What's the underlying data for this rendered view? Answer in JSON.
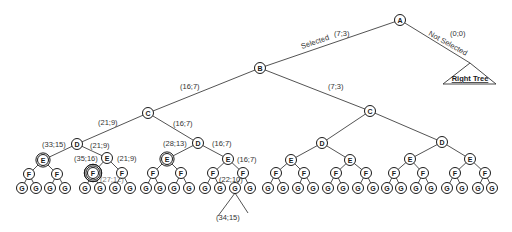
{
  "diagram": {
    "title": "",
    "node_radius": 5.5,
    "nodes": [
      {
        "id": "A",
        "label": "A",
        "x": 400,
        "y": 20
      },
      {
        "id": "B",
        "label": "B",
        "x": 260,
        "y": 68
      },
      {
        "id": "C1",
        "label": "C",
        "x": 148,
        "y": 113
      },
      {
        "id": "C2",
        "label": "C",
        "x": 370,
        "y": 111
      },
      {
        "id": "D1",
        "label": "D",
        "x": 77,
        "y": 144
      },
      {
        "id": "D2",
        "label": "D",
        "x": 198,
        "y": 143
      },
      {
        "id": "D3",
        "label": "D",
        "x": 322,
        "y": 143
      },
      {
        "id": "D4",
        "label": "D",
        "x": 442,
        "y": 142
      },
      {
        "id": "E1",
        "label": "E",
        "x": 43,
        "y": 160,
        "rings": 2
      },
      {
        "id": "E2",
        "label": "E",
        "x": 107,
        "y": 158
      },
      {
        "id": "E3",
        "label": "E",
        "x": 167,
        "y": 159,
        "rings": 2
      },
      {
        "id": "E4",
        "label": "E",
        "x": 228,
        "y": 159
      },
      {
        "id": "E5",
        "label": "E",
        "x": 291,
        "y": 160
      },
      {
        "id": "E6",
        "label": "E",
        "x": 350,
        "y": 160
      },
      {
        "id": "E7",
        "label": "E",
        "x": 410,
        "y": 159
      },
      {
        "id": "E8",
        "label": "E",
        "x": 470,
        "y": 159
      },
      {
        "id": "F1",
        "label": "F",
        "x": 29,
        "y": 174
      },
      {
        "id": "F2",
        "label": "F",
        "x": 57,
        "y": 174
      },
      {
        "id": "F3",
        "label": "F",
        "x": 93,
        "y": 173,
        "rings": 3
      },
      {
        "id": "F4",
        "label": "F",
        "x": 122,
        "y": 173
      },
      {
        "id": "F5",
        "label": "F",
        "x": 153,
        "y": 173
      },
      {
        "id": "F6",
        "label": "F",
        "x": 181,
        "y": 173
      },
      {
        "id": "F7",
        "label": "F",
        "x": 213,
        "y": 173
      },
      {
        "id": "F8",
        "label": "F",
        "x": 243,
        "y": 173
      },
      {
        "id": "F9",
        "label": "F",
        "x": 276,
        "y": 173
      },
      {
        "id": "F10",
        "label": "F",
        "x": 304,
        "y": 173
      },
      {
        "id": "F11",
        "label": "F",
        "x": 336,
        "y": 173
      },
      {
        "id": "F12",
        "label": "F",
        "x": 366,
        "y": 173
      },
      {
        "id": "F13",
        "label": "F",
        "x": 394,
        "y": 173
      },
      {
        "id": "F14",
        "label": "F",
        "x": 423,
        "y": 173
      },
      {
        "id": "F15",
        "label": "F",
        "x": 455,
        "y": 173
      },
      {
        "id": "F16",
        "label": "F",
        "x": 485,
        "y": 173
      },
      {
        "id": "G1",
        "label": "G",
        "x": 22,
        "y": 188
      },
      {
        "id": "G2",
        "label": "G",
        "x": 36,
        "y": 188
      },
      {
        "id": "G3",
        "label": "G",
        "x": 50,
        "y": 188
      },
      {
        "id": "G4",
        "label": "G",
        "x": 65,
        "y": 188
      },
      {
        "id": "G5",
        "label": "G",
        "x": 85,
        "y": 188
      },
      {
        "id": "G6",
        "label": "G",
        "x": 100,
        "y": 188
      },
      {
        "id": "G7",
        "label": "G",
        "x": 115,
        "y": 188
      },
      {
        "id": "G8",
        "label": "G",
        "x": 130,
        "y": 188
      },
      {
        "id": "G9",
        "label": "G",
        "x": 146,
        "y": 188
      },
      {
        "id": "G10",
        "label": "G",
        "x": 160,
        "y": 188
      },
      {
        "id": "G11",
        "label": "G",
        "x": 174,
        "y": 188
      },
      {
        "id": "G12",
        "label": "G",
        "x": 189,
        "y": 188
      },
      {
        "id": "G13",
        "label": "G",
        "x": 205,
        "y": 188
      },
      {
        "id": "G14",
        "label": "G",
        "x": 220,
        "y": 188
      },
      {
        "id": "G15",
        "label": "G",
        "x": 235,
        "y": 188
      },
      {
        "id": "G16",
        "label": "G",
        "x": 250,
        "y": 188
      },
      {
        "id": "G17",
        "label": "G",
        "x": 268,
        "y": 188
      },
      {
        "id": "G18",
        "label": "G",
        "x": 283,
        "y": 188
      },
      {
        "id": "G19",
        "label": "G",
        "x": 298,
        "y": 188
      },
      {
        "id": "G20",
        "label": "G",
        "x": 313,
        "y": 188
      },
      {
        "id": "G21",
        "label": "G",
        "x": 328,
        "y": 188
      },
      {
        "id": "G22",
        "label": "G",
        "x": 343,
        "y": 188
      },
      {
        "id": "G23",
        "label": "G",
        "x": 358,
        "y": 188
      },
      {
        "id": "G24",
        "label": "G",
        "x": 373,
        "y": 188
      },
      {
        "id": "G25",
        "label": "G",
        "x": 387,
        "y": 188
      },
      {
        "id": "G26",
        "label": "G",
        "x": 401,
        "y": 188
      },
      {
        "id": "G27",
        "label": "G",
        "x": 416,
        "y": 188
      },
      {
        "id": "G28",
        "label": "G",
        "x": 431,
        "y": 188
      },
      {
        "id": "G29",
        "label": "G",
        "x": 447,
        "y": 188
      },
      {
        "id": "G30",
        "label": "G",
        "x": 462,
        "y": 188
      },
      {
        "id": "G31",
        "label": "G",
        "x": 478,
        "y": 188
      },
      {
        "id": "G32",
        "label": "G",
        "x": 492,
        "y": 188
      }
    ],
    "edges": [
      [
        "A",
        "B"
      ],
      [
        "B",
        "C1"
      ],
      [
        "B",
        "C2"
      ],
      [
        "C1",
        "D1"
      ],
      [
        "C1",
        "D2"
      ],
      [
        "C2",
        "D3"
      ],
      [
        "C2",
        "D4"
      ],
      [
        "D1",
        "E1"
      ],
      [
        "D1",
        "E2"
      ],
      [
        "D2",
        "E3"
      ],
      [
        "D2",
        "E4"
      ],
      [
        "D3",
        "E5"
      ],
      [
        "D3",
        "E6"
      ],
      [
        "D4",
        "E7"
      ],
      [
        "D4",
        "E8"
      ],
      [
        "E1",
        "F1"
      ],
      [
        "E1",
        "F2"
      ],
      [
        "E2",
        "F3"
      ],
      [
        "E2",
        "F4"
      ],
      [
        "E3",
        "F5"
      ],
      [
        "E3",
        "F6"
      ],
      [
        "E4",
        "F7"
      ],
      [
        "E4",
        "F8"
      ],
      [
        "E5",
        "F9"
      ],
      [
        "E5",
        "F10"
      ],
      [
        "E6",
        "F11"
      ],
      [
        "E6",
        "F12"
      ],
      [
        "E7",
        "F13"
      ],
      [
        "E7",
        "F14"
      ],
      [
        "E8",
        "F15"
      ],
      [
        "E8",
        "F16"
      ],
      [
        "F1",
        "G1"
      ],
      [
        "F1",
        "G2"
      ],
      [
        "F2",
        "G3"
      ],
      [
        "F2",
        "G4"
      ],
      [
        "F3",
        "G5"
      ],
      [
        "F3",
        "G6"
      ],
      [
        "F4",
        "G7"
      ],
      [
        "F4",
        "G8"
      ],
      [
        "F5",
        "G9"
      ],
      [
        "F5",
        "G10"
      ],
      [
        "F6",
        "G11"
      ],
      [
        "F6",
        "G12"
      ],
      [
        "F7",
        "G13"
      ],
      [
        "F7",
        "G14"
      ],
      [
        "F8",
        "G15"
      ],
      [
        "F8",
        "G16"
      ],
      [
        "F9",
        "G17"
      ],
      [
        "F9",
        "G18"
      ],
      [
        "F10",
        "G19"
      ],
      [
        "F10",
        "G20"
      ],
      [
        "F11",
        "G21"
      ],
      [
        "F11",
        "G22"
      ],
      [
        "F12",
        "G23"
      ],
      [
        "F12",
        "G24"
      ],
      [
        "F13",
        "G25"
      ],
      [
        "F13",
        "G26"
      ],
      [
        "F14",
        "G27"
      ],
      [
        "F14",
        "G28"
      ],
      [
        "F15",
        "G29"
      ],
      [
        "F15",
        "G30"
      ],
      [
        "F16",
        "G31"
      ],
      [
        "F16",
        "G32"
      ]
    ],
    "extra_lines": [
      {
        "x1": 235,
        "y1": 193,
        "x2": 218,
        "y2": 216
      },
      {
        "x1": 235,
        "y1": 193,
        "x2": 248,
        "y2": 213
      }
    ],
    "right_tree": {
      "edge_from": "A",
      "apex": {
        "x": 470,
        "y": 63
      },
      "base_left": {
        "x": 443,
        "y": 84
      },
      "base_right": {
        "x": 496,
        "y": 84
      },
      "label": "Right Tree",
      "label_x": 470,
      "label_y": 81
    },
    "edge_labels": [
      {
        "text": "Selected",
        "x": 302,
        "y": 49,
        "rotate": -19
      },
      {
        "text": "(7;3)",
        "x": 334,
        "y": 36
      },
      {
        "text": "Not Selected",
        "x": 428,
        "y": 35,
        "rotate": 29
      },
      {
        "text": "(0;0)",
        "x": 450,
        "y": 36
      },
      {
        "text": "(16;7)",
        "x": 180,
        "y": 89
      },
      {
        "text": "(7;3)",
        "x": 328,
        "y": 89
      },
      {
        "text": "(21;9)",
        "x": 98,
        "y": 125
      },
      {
        "text": "(16;7)",
        "x": 173,
        "y": 126
      },
      {
        "text": "(33;15)",
        "x": 42,
        "y": 147
      },
      {
        "text": "(21;9)",
        "x": 90,
        "y": 148
      },
      {
        "text": "(28;13)",
        "x": 163,
        "y": 146
      },
      {
        "text": "(16;7)",
        "x": 212,
        "y": 146
      },
      {
        "text": "(35;16)",
        "x": 74,
        "y": 161
      },
      {
        "text": "(21;9)",
        "x": 117,
        "y": 161
      },
      {
        "text": "(16;7)",
        "x": 237,
        "y": 162
      },
      {
        "text": "(27;12)",
        "x": 100,
        "y": 182,
        "style": "gray"
      },
      {
        "text": "(22;10)",
        "x": 219,
        "y": 182
      },
      {
        "text": "(34;15)",
        "x": 216,
        "y": 220
      }
    ]
  }
}
